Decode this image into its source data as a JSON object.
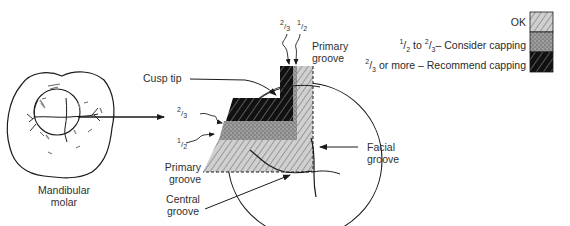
{
  "figure": {
    "molar_label_line1": "Mandibular",
    "molar_label_line2": "molar",
    "labels": {
      "cusp_tip": "Cusp tip",
      "primary_groove_top_line1": "Primary",
      "primary_groove_top_line2": "groove",
      "primary_groove_left_line1": "Primary",
      "primary_groove_left_line2": "groove",
      "central_groove_line1": "Central",
      "central_groove_line2": "groove",
      "facial_groove_line1": "Facial",
      "facial_groove_line2": "groove"
    },
    "fraction_markers": {
      "top_two_thirds": {
        "num": "2",
        "den": "3"
      },
      "top_one_half": {
        "num": "1",
        "den": "2"
      },
      "left_two_thirds": {
        "num": "2",
        "den": "3"
      },
      "left_one_half": {
        "num": "1",
        "den": "2"
      }
    }
  },
  "legend": {
    "items": [
      {
        "label": "OK",
        "pattern": "light-hatch",
        "color": "#cfcfcf"
      },
      {
        "label_prefix_num": "1",
        "label_prefix_den": "2",
        "label_mid": " to ",
        "label_mid_num": "2",
        "label_mid_den": "3",
        "label": "– Consider capping",
        "pattern": "stipple",
        "color": "#8a8a8a"
      },
      {
        "label_prefix_num": "2",
        "label_prefix_den": "3",
        "label": " or more – Recommend capping",
        "pattern": "dark-hatch",
        "color": "#111111"
      }
    ]
  },
  "colors": {
    "line": "#1a1a1a",
    "ok_fill": "#cfcfcf",
    "consider_fill": "#8c8c8c",
    "recommend_fill": "#121212"
  }
}
